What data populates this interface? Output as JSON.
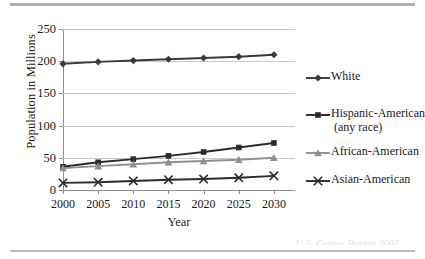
{
  "figure": {
    "source_note": "U.S. Census Bureau 2007"
  },
  "chart_data": {
    "type": "line",
    "title": "",
    "xlabel": "Year",
    "ylabel": "Population in Millions",
    "categories": [
      "2000",
      "2005",
      "2010",
      "2015",
      "2020",
      "2025",
      "2030"
    ],
    "x": [
      2000,
      2005,
      2010,
      2015,
      2020,
      2025,
      2030
    ],
    "xlim": [
      2000,
      2033
    ],
    "ylim": [
      0,
      250
    ],
    "yticks": [
      0,
      50,
      100,
      150,
      200,
      250
    ],
    "ytick_labels": [
      "0",
      "50",
      "100",
      "150",
      "200",
      "250"
    ],
    "grid": "horizontal",
    "legend_position": "right",
    "series": [
      {
        "name": "White",
        "label": "White",
        "marker": "diamond",
        "color": "#3a3a3a",
        "values": [
          196,
          199,
          201,
          203,
          205,
          207,
          210
        ]
      },
      {
        "name": "Hispanic-American (any race)",
        "label": "Hispanic-American",
        "label_line2": "(any race)",
        "marker": "square",
        "color": "#2b2b2b",
        "values": [
          36,
          43,
          48,
          53,
          59,
          66,
          73
        ]
      },
      {
        "name": "African-American",
        "label": "African-American",
        "marker": "triangle",
        "color": "#8f8f8f",
        "values": [
          34,
          37,
          40,
          43,
          45,
          47,
          50
        ]
      },
      {
        "name": "Asian-American",
        "label": "Asian-American",
        "marker": "x",
        "color": "#2b2b2b",
        "values": [
          11,
          12,
          14,
          16,
          17,
          19,
          22
        ]
      }
    ]
  }
}
